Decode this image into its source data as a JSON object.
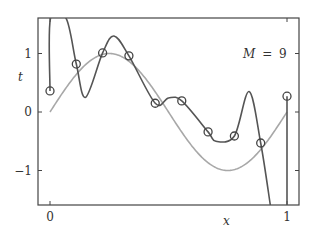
{
  "chart_data": {
    "type": "line",
    "title": "",
    "annotation": {
      "variable": "M",
      "equals": "=",
      "value": "9"
    },
    "xlabel": "x",
    "ylabel": "t",
    "xlim": [
      -0.05,
      1.05
    ],
    "ylim": [
      -1.6,
      1.6
    ],
    "xticks": [
      {
        "value": 0,
        "label": "0"
      },
      {
        "value": 1,
        "label": "1"
      }
    ],
    "yticks": [
      {
        "value": -1,
        "label": "−1"
      },
      {
        "value": 0,
        "label": "0"
      },
      {
        "value": 1,
        "label": "1"
      }
    ],
    "grid": false,
    "legend": null,
    "series": [
      {
        "name": "training data",
        "kind": "scatter",
        "marker": "open-circle",
        "x": [
          0.0,
          0.111,
          0.222,
          0.333,
          0.444,
          0.556,
          0.667,
          0.778,
          0.889,
          1.0
        ],
        "t": [
          0.36,
          0.82,
          1.01,
          0.96,
          0.15,
          0.19,
          -0.34,
          -0.41,
          -0.53,
          0.27
        ]
      },
      {
        "name": "sin(2πx)",
        "kind": "line",
        "color": "#a8a8a8",
        "function": "sin(2*pi*x)",
        "x_range": [
          0,
          1
        ]
      },
      {
        "name": "M = 9 polynomial fit",
        "kind": "line",
        "color": "#555555",
        "note": "interpolates all 10 points; oscillates wildly, exceeding plot range near x=0 and x≈0.95",
        "approx_points": [
          [
            0.0,
            0.36
          ],
          [
            0.002,
            1.6
          ],
          [
            0.068,
            1.6
          ],
          [
            0.111,
            0.82
          ],
          [
            0.15,
            0.25
          ],
          [
            0.222,
            1.01
          ],
          [
            0.27,
            1.3
          ],
          [
            0.333,
            0.96
          ],
          [
            0.444,
            0.15
          ],
          [
            0.5,
            0.24
          ],
          [
            0.556,
            0.19
          ],
          [
            0.667,
            -0.34
          ],
          [
            0.7,
            -0.5
          ],
          [
            0.778,
            -0.41
          ],
          [
            0.84,
            0.35
          ],
          [
            0.889,
            -0.53
          ],
          [
            0.93,
            -1.6
          ]
        ]
      }
    ]
  }
}
